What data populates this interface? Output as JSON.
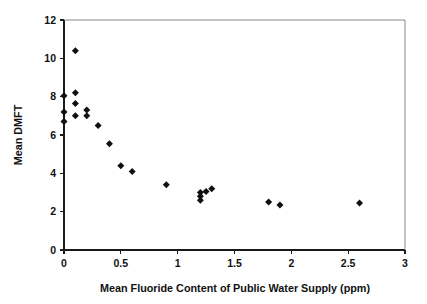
{
  "chart_data": {
    "type": "scatter",
    "title": "",
    "xlabel": "Mean Fluoride Content of Public Water Supply (ppm)",
    "ylabel": "Mean DMFT",
    "xlim": [
      0,
      3
    ],
    "ylim": [
      0,
      12
    ],
    "xticks": [
      0,
      0.5,
      1,
      1.5,
      2,
      2.5,
      3
    ],
    "xtick_labels": [
      "0",
      "0.5",
      "1",
      "1.5",
      "2",
      "2.5",
      "3"
    ],
    "yticks": [
      0,
      2,
      4,
      6,
      8,
      10,
      12
    ],
    "ytick_labels": [
      "0",
      "2",
      "4",
      "6",
      "8",
      "10",
      "12"
    ],
    "grid": false,
    "legend": null,
    "marker": "diamond",
    "marker_color": "#101010",
    "series": [
      {
        "name": "Mean DMFT vs fluoride",
        "points": [
          {
            "x": 0.0,
            "y": 8.05
          },
          {
            "x": 0.0,
            "y": 7.2
          },
          {
            "x": 0.0,
            "y": 6.7
          },
          {
            "x": 0.1,
            "y": 10.4
          },
          {
            "x": 0.1,
            "y": 8.2
          },
          {
            "x": 0.1,
            "y": 7.65
          },
          {
            "x": 0.1,
            "y": 7.0
          },
          {
            "x": 0.2,
            "y": 7.3
          },
          {
            "x": 0.2,
            "y": 7.0
          },
          {
            "x": 0.3,
            "y": 6.5
          },
          {
            "x": 0.4,
            "y": 5.55
          },
          {
            "x": 0.5,
            "y": 4.4
          },
          {
            "x": 0.6,
            "y": 4.1
          },
          {
            "x": 0.9,
            "y": 3.4
          },
          {
            "x": 1.2,
            "y": 3.0
          },
          {
            "x": 1.2,
            "y": 2.8
          },
          {
            "x": 1.2,
            "y": 2.6
          },
          {
            "x": 1.25,
            "y": 3.05
          },
          {
            "x": 1.3,
            "y": 3.2
          },
          {
            "x": 1.8,
            "y": 2.5
          },
          {
            "x": 1.9,
            "y": 2.35
          },
          {
            "x": 2.6,
            "y": 2.45
          }
        ]
      }
    ]
  },
  "layout": {
    "plot_left_px": 64,
    "plot_right_px": 405,
    "plot_top_px": 20,
    "plot_bottom_px": 250
  }
}
